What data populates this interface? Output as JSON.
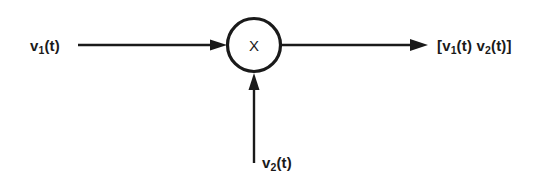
{
  "diagram": {
    "background_color": "#ffffff",
    "stroke_color": "#1a1a1a",
    "node": {
      "shape": "circle",
      "operator_label": "X",
      "name": "multiplier-node",
      "center_x": 254,
      "center_y": 45,
      "radius": 27
    },
    "labels": {
      "input1": {
        "base": "v",
        "sub": "1",
        "suffix": "(t)"
      },
      "input2": {
        "base": "v",
        "sub": "2",
        "suffix": "(t)"
      },
      "output": {
        "open_bracket": "[",
        "term1_base": "v",
        "term1_sub": "1",
        "term1_suffix": "(t)",
        "spacer": " ",
        "term2_base": "v",
        "term2_sub": "2",
        "term2_suffix": "(t)",
        "close_bracket": "]"
      }
    },
    "connections": [
      {
        "name": "input1-arrow",
        "from_x": 78,
        "from_y": 45,
        "to_x": 227,
        "to_y": 45,
        "direction": "right"
      },
      {
        "name": "input2-arrow",
        "from_x": 254,
        "from_y": 163,
        "to_x": 254,
        "to_y": 73,
        "direction": "up"
      },
      {
        "name": "output-arrow",
        "from_x": 281,
        "from_y": 45,
        "to_x": 428,
        "to_y": 45,
        "direction": "right"
      }
    ]
  }
}
